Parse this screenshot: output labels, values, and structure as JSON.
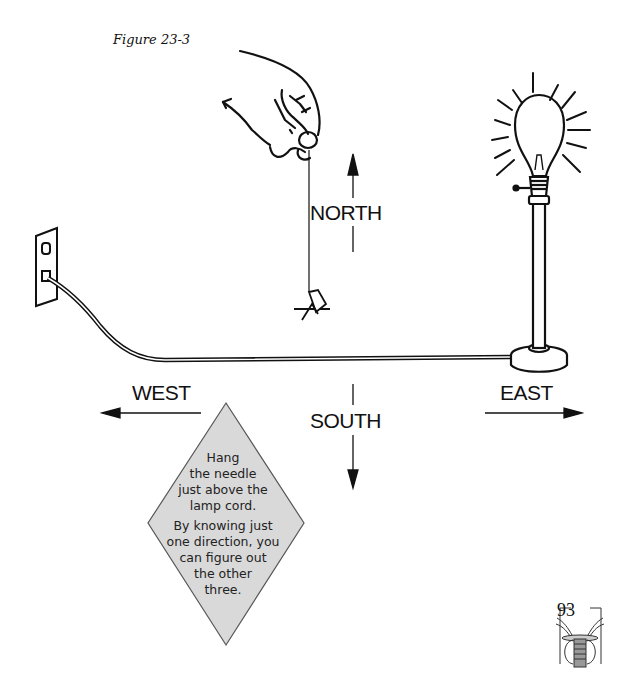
{
  "figure": {
    "caption": "Figure 23-3"
  },
  "directions": {
    "north": "NORTH",
    "south": "SOUTH",
    "east": "EAST",
    "west": "WEST"
  },
  "callout": {
    "lines_1": [
      "Hang",
      "the needle",
      "just above the",
      "lamp cord."
    ],
    "lines_2": [
      "By knowing just",
      "one direction, you",
      "can figure out",
      "the other",
      "three."
    ],
    "fill_color": "#d9d9d9"
  },
  "page": {
    "number": "93"
  },
  "illustration": {
    "elements": [
      "hand-holding-thread",
      "needle",
      "lamp-cord",
      "wall-outlet",
      "lamp-with-glowing-bulb"
    ]
  }
}
